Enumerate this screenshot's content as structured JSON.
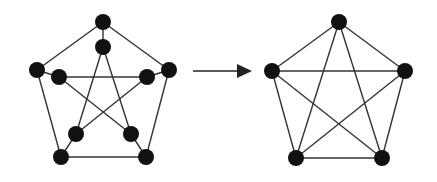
{
  "diagram": {
    "colors": {
      "node": "#111111",
      "edge": "#333333",
      "arrow": "#222222",
      "background": "#ffffff"
    },
    "node_radius": 8,
    "edge_width": 1.4,
    "left_graph": {
      "name": "petersen-graph",
      "nodes": [
        {
          "id": "o0",
          "x": 103,
          "y": 22
        },
        {
          "id": "o1",
          "x": 169,
          "y": 70
        },
        {
          "id": "o2",
          "x": 146,
          "y": 157
        },
        {
          "id": "o3",
          "x": 61,
          "y": 157
        },
        {
          "id": "o4",
          "x": 37,
          "y": 70
        },
        {
          "id": "i0",
          "x": 103,
          "y": 47
        },
        {
          "id": "i1",
          "x": 147,
          "y": 77
        },
        {
          "id": "i2",
          "x": 131,
          "y": 134
        },
        {
          "id": "i3",
          "x": 76,
          "y": 134
        },
        {
          "id": "i4",
          "x": 59,
          "y": 77
        }
      ],
      "edges": [
        [
          "o0",
          "o1"
        ],
        [
          "o1",
          "o2"
        ],
        [
          "o2",
          "o3"
        ],
        [
          "o3",
          "o4"
        ],
        [
          "o4",
          "o0"
        ],
        [
          "o0",
          "i0"
        ],
        [
          "o1",
          "i1"
        ],
        [
          "o2",
          "i2"
        ],
        [
          "o3",
          "i3"
        ],
        [
          "o4",
          "i4"
        ],
        [
          "i0",
          "i2"
        ],
        [
          "i0",
          "i3"
        ],
        [
          "i1",
          "i3"
        ],
        [
          "i1",
          "i4"
        ],
        [
          "i4",
          "i2"
        ]
      ]
    },
    "arrow": {
      "x1": 193,
      "y1": 71,
      "x2": 252,
      "y2": 71,
      "head_length": 15,
      "head_width": 14
    },
    "right_graph": {
      "name": "complete-graph-k5",
      "nodes": [
        {
          "id": "k0",
          "x": 339,
          "y": 22
        },
        {
          "id": "k1",
          "x": 405,
          "y": 71
        },
        {
          "id": "k2",
          "x": 382,
          "y": 158
        },
        {
          "id": "k3",
          "x": 296,
          "y": 158
        },
        {
          "id": "k4",
          "x": 272,
          "y": 71
        }
      ],
      "edges": [
        [
          "k0",
          "k1"
        ],
        [
          "k1",
          "k2"
        ],
        [
          "k2",
          "k3"
        ],
        [
          "k3",
          "k4"
        ],
        [
          "k4",
          "k0"
        ],
        [
          "k0",
          "k2"
        ],
        [
          "k0",
          "k3"
        ],
        [
          "k1",
          "k3"
        ],
        [
          "k1",
          "k4"
        ],
        [
          "k2",
          "k4"
        ]
      ]
    }
  }
}
